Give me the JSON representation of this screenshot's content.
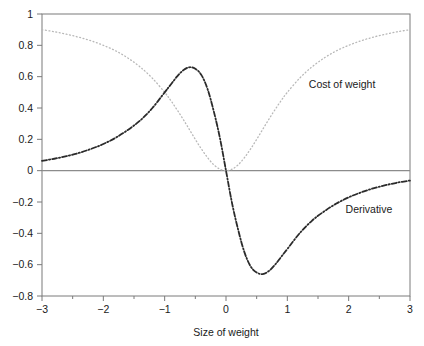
{
  "chart_data": {
    "type": "line",
    "title": "",
    "xlabel": "Size of weight",
    "ylabel": "",
    "xlim": [
      -3,
      3
    ],
    "ylim": [
      -0.8,
      1
    ],
    "grid": false,
    "legend_position": "inline-annotation",
    "xticks": [
      -3,
      -2,
      -1,
      0,
      1,
      2,
      3
    ],
    "xtick_labels": [
      "−3",
      "−2",
      "−1",
      "0",
      "1",
      "2",
      "3"
    ],
    "xminor_step": 0.5,
    "yticks": [
      -0.8,
      -0.6,
      -0.4,
      -0.2,
      0,
      0.2,
      0.4,
      0.6,
      0.8,
      1
    ],
    "ytick_labels": [
      "−0.8",
      "−0.6",
      "−0.4",
      "−0.2",
      "0",
      "0.2",
      "0.4",
      "0.6",
      "0.8",
      "1"
    ],
    "zero_line": 0,
    "colors": {
      "cost": "#b8b8b8",
      "derivative": "#2b2b2b",
      "axis": "#7a7a7a",
      "zero_line": "#8c8c8c",
      "text": "#1a1a1a"
    },
    "series": [
      {
        "name": "Cost of weight",
        "style": "dotted",
        "color": "#b8b8b8",
        "label_x": 1.35,
        "label_y": 0.53,
        "x": [
          -3,
          -2.8,
          -2.6,
          -2.4,
          -2.2,
          -2,
          -1.8,
          -1.6,
          -1.4,
          -1.2,
          -1,
          -0.9,
          -0.8,
          -0.7,
          -0.6,
          -0.5,
          -0.4,
          -0.3,
          -0.2,
          -0.1,
          0,
          0.1,
          0.2,
          0.3,
          0.4,
          0.5,
          0.6,
          0.7,
          0.8,
          0.9,
          1,
          1.2,
          1.4,
          1.6,
          1.8,
          2,
          2.2,
          2.4,
          2.6,
          2.8,
          3
        ],
        "values": [
          0.9,
          0.887,
          0.871,
          0.852,
          0.829,
          0.8,
          0.765,
          0.719,
          0.662,
          0.59,
          0.5,
          0.448,
          0.39,
          0.329,
          0.265,
          0.2,
          0.138,
          0.083,
          0.038,
          0.0098,
          0,
          0.0098,
          0.038,
          0.083,
          0.138,
          0.2,
          0.265,
          0.329,
          0.39,
          0.448,
          0.5,
          0.59,
          0.662,
          0.719,
          0.765,
          0.8,
          0.829,
          0.852,
          0.871,
          0.887,
          0.9
        ]
      },
      {
        "name": "Derivative",
        "style": "dash-dot",
        "color": "#2b2b2b",
        "label_x": 1.95,
        "label_y": -0.27,
        "x": [
          -3,
          -2.8,
          -2.6,
          -2.4,
          -2.2,
          -2,
          -1.8,
          -1.6,
          -1.4,
          -1.2,
          -1,
          -0.9,
          -0.8,
          -0.7,
          -0.6,
          -0.5,
          -0.4,
          -0.3,
          -0.2,
          -0.1,
          0,
          0.1,
          0.2,
          0.3,
          0.4,
          0.5,
          0.6,
          0.7,
          0.8,
          0.9,
          1,
          1.2,
          1.4,
          1.6,
          1.8,
          2,
          2.2,
          2.4,
          2.6,
          2.8,
          3
        ],
        "values": [
          0.063,
          0.076,
          0.093,
          0.113,
          0.139,
          0.17,
          0.21,
          0.26,
          0.32,
          0.4,
          0.5,
          0.55,
          0.6,
          0.64,
          0.66,
          0.65,
          0.61,
          0.52,
          0.38,
          0.21,
          0,
          -0.21,
          -0.38,
          -0.52,
          -0.61,
          -0.65,
          -0.66,
          -0.64,
          -0.6,
          -0.55,
          -0.5,
          -0.4,
          -0.32,
          -0.26,
          -0.21,
          -0.17,
          -0.139,
          -0.113,
          -0.093,
          -0.076,
          -0.063
        ]
      }
    ]
  },
  "axes": {
    "x_axis_title": "Size of weight",
    "y_axis_title": ""
  }
}
